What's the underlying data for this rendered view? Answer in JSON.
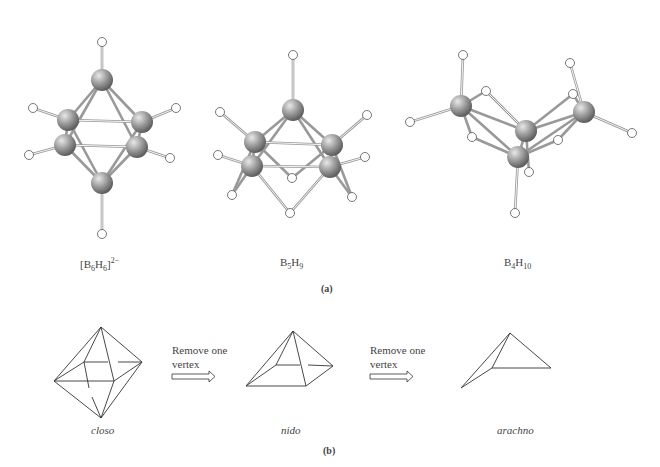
{
  "part_a": {
    "label": "(a)",
    "molecules": [
      {
        "id": "b6h6",
        "formula_parts": [
          "[B",
          "6",
          "H",
          "6",
          "]",
          "2−"
        ],
        "name": "[B6H6]2-"
      },
      {
        "id": "b5h9",
        "formula_parts": [
          "B",
          "5",
          "H",
          "9"
        ],
        "name": "B5H9"
      },
      {
        "id": "b4h10",
        "formula_parts": [
          "B",
          "4",
          "H",
          "10"
        ],
        "name": "B4H10"
      }
    ]
  },
  "part_b": {
    "label": "(b)",
    "shapes": [
      {
        "id": "closo",
        "name": "closo"
      },
      {
        "id": "nido",
        "name": "nido"
      },
      {
        "id": "arachno",
        "name": "arachno"
      }
    ],
    "arrows": [
      {
        "line1": "Remove one",
        "line2": "vertex"
      },
      {
        "line1": "Remove one",
        "line2": "vertex"
      }
    ]
  },
  "colors": {
    "boron": "#8a8a8a",
    "hydrogen": "#ffffff",
    "bond": "#9a9a9a",
    "line": "#333333"
  }
}
